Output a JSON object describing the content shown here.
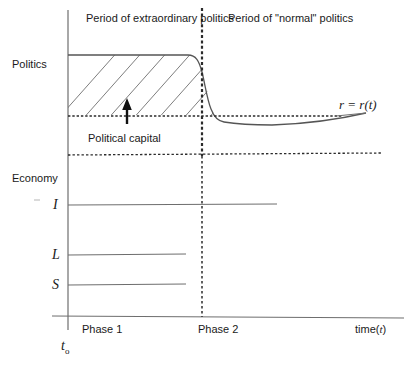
{
  "figure": {
    "type": "diagram",
    "title_labels": {
      "extraordinary_politics": "Period of extraordinary politics",
      "normal_politics": "Period of \"normal\" politics"
    },
    "axes": {
      "y_upper_label": "Politics",
      "y_lower_label": "Economy",
      "x_label_prefix": "time(",
      "x_label_var": "t",
      "x_label_suffix": ")",
      "origin_label": "t",
      "origin_sub": "o"
    },
    "annotations": {
      "political_capital": "Political capital",
      "curve_label": "r = r(t)"
    },
    "phases": {
      "phase1": "Phase 1",
      "phase2": "Phase 2"
    },
    "economy_series": [
      {
        "name": "I",
        "label": "I"
      },
      {
        "name": "L",
        "label": "L"
      },
      {
        "name": "S",
        "label": "S"
      }
    ],
    "colors": {
      "line": "#6e6e6e",
      "dark_line": "#2b2b2b",
      "text": "#1a1a1a",
      "background": "#ffffff"
    }
  }
}
